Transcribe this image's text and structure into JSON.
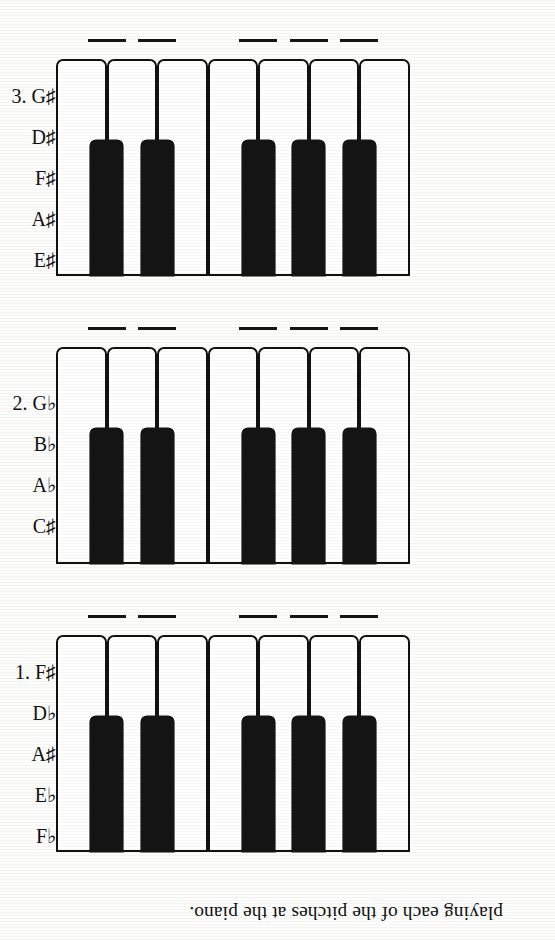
{
  "page": {
    "caption": "playing each of the pitches at the piano.",
    "background_color": "#fdfdfc",
    "ink_color": "#111111",
    "rotation_degrees": 180
  },
  "keyboard": {
    "white_key_count": 7,
    "black_key_count": 5,
    "black_key_slots": [
      0,
      1,
      2,
      4,
      5
    ],
    "blank_count_per_exercise": 5
  },
  "exercises": [
    {
      "number": "1.",
      "answers": [
        {
          "letter": "F",
          "accidental": "♯",
          "text": "F♯"
        },
        {
          "letter": "D",
          "accidental": "♭",
          "text": "D♭"
        },
        {
          "letter": "A",
          "accidental": "♯",
          "text": "A♯"
        },
        {
          "letter": "E",
          "accidental": "♭",
          "text": "E♭"
        },
        {
          "letter": "F",
          "accidental": "♭",
          "text": "F♭"
        }
      ],
      "first_label": "1. F♯",
      "labels": [
        "1. F♯",
        "D♭",
        "A♯",
        "E♭",
        "F♭"
      ]
    },
    {
      "number": "2.",
      "answers": [
        {
          "letter": "G",
          "accidental": "♭",
          "text": "G♭"
        },
        {
          "letter": "B",
          "accidental": "♭",
          "text": "B♭"
        },
        {
          "letter": "A",
          "accidental": "♭",
          "text": "A♭"
        },
        {
          "letter": "C",
          "accidental": "♯",
          "text": "C♯"
        }
      ],
      "first_label": "2. G♭",
      "labels": [
        "2. G♭",
        "B♭",
        "A♭",
        "C♯"
      ]
    },
    {
      "number": "3.",
      "answers": [
        {
          "letter": "G",
          "accidental": "♯",
          "text": "G♯"
        },
        {
          "letter": "D",
          "accidental": "♯",
          "text": "D♯"
        },
        {
          "letter": "F",
          "accidental": "♯",
          "text": "F♯"
        },
        {
          "letter": "A",
          "accidental": "♯",
          "text": "A♯"
        },
        {
          "letter": "E",
          "accidental": "♯",
          "text": "E♯"
        }
      ],
      "first_label": "3. G♯",
      "labels": [
        "3. G♯",
        "D♯",
        "F♯",
        "A♯",
        "E♯"
      ]
    }
  ]
}
